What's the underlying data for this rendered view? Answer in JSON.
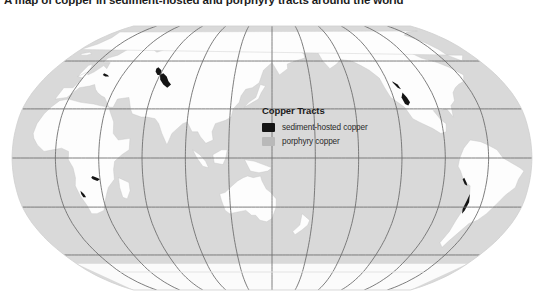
{
  "title": "A map of copper in sediment-hosted and porphyry tracts around the world",
  "legend": {
    "title": "Copper Tracts",
    "items": [
      {
        "label": "sediment-hosted copper",
        "color": "#141414",
        "key": "sediment-hosted"
      },
      {
        "label": "porphyry copper",
        "color": "#b9b9b9",
        "key": "porphyry"
      }
    ]
  },
  "map": {
    "projection": "robinson",
    "center_longitude": 150,
    "ocean_color": "#d9d9d9",
    "land_color": "#fdfdfd",
    "graticule_color": "#6f6f6f",
    "outline_color": "#cfcfcf",
    "tract_sediment_color": "#141414",
    "tract_porphyry_color": "#b9b9b9",
    "graticule": {
      "meridian_step_degrees": 30,
      "parallel_latitudes": [
        60,
        30,
        0,
        -30,
        -60
      ],
      "visible": true
    },
    "antarctica_edge_color": "#e4e4e4",
    "tract_regions": [
      {
        "name": "Central Asia / Kazakhstan belt",
        "type": "sediment-hosted"
      },
      {
        "name": "Central African Copperbelt",
        "type": "sediment-hosted"
      },
      {
        "name": "Southwest North America belt",
        "type": "sediment-hosted"
      },
      {
        "name": "Andean belt (Chile-Peru)",
        "type": "sediment-hosted"
      },
      {
        "name": "Eastern Europe Kupferschiefer",
        "type": "sediment-hosted"
      },
      {
        "name": "Southern Africa (Namibia)",
        "type": "sediment-hosted"
      }
    ]
  }
}
